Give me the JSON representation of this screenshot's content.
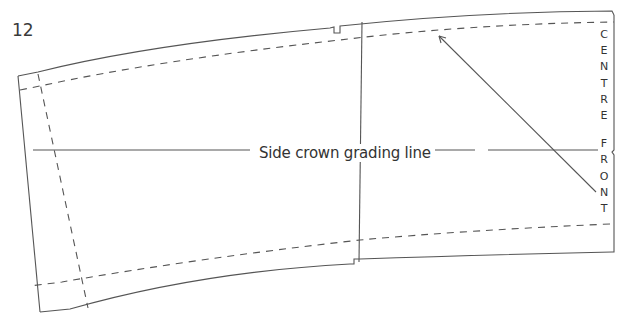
{
  "figure": {
    "number": "12",
    "grading_line_label": "Side crown grading line",
    "centre_front_letters": [
      "C",
      "E",
      "N",
      "T",
      "R",
      "E",
      "",
      "F",
      "R",
      "O",
      "N",
      "T"
    ],
    "line_color": "#555555",
    "text_color": "#333333"
  }
}
